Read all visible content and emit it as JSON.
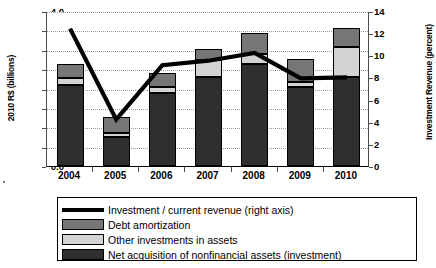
{
  "chart_data": {
    "type": "bar",
    "title": "",
    "xlabel": "",
    "ylabel": "2010 R$ (billions)",
    "y2label": "Investment Revenue (percent)",
    "categories": [
      "2004",
      "2005",
      "2006",
      "2007",
      "2008",
      "2009",
      "2010"
    ],
    "ylim": [
      0.0,
      4.0
    ],
    "yticks": [
      "0.0",
      "0.5",
      "1.0",
      "1.5",
      "2.0",
      "2.5",
      "3.0",
      "3.5",
      "4.0"
    ],
    "ytick_values": [
      0.0,
      0.5,
      1.0,
      1.5,
      2.0,
      2.5,
      3.0,
      3.5,
      4.0
    ],
    "y2lim": [
      0,
      14
    ],
    "y2ticks": [
      "0",
      "2",
      "4",
      "6",
      "8",
      "10",
      "12",
      "14"
    ],
    "y2tick_values": [
      0,
      2,
      4,
      6,
      8,
      10,
      12,
      14
    ],
    "grid": true,
    "stacked": true,
    "legend_position": "below",
    "series": [
      {
        "name": "Net acquisition of nonfinancial assets (investment)",
        "axis": "left",
        "kind": "bar",
        "color": "#2f2f2f",
        "values": [
          2.1,
          0.75,
          1.88,
          2.3,
          2.63,
          2.05,
          2.3
        ]
      },
      {
        "name": "Other investments in assets",
        "axis": "left",
        "kind": "bar",
        "color": "#d3d3d3",
        "values": [
          0.18,
          0.1,
          0.15,
          0.43,
          0.25,
          0.12,
          0.78
        ]
      },
      {
        "name": "Debt amortization",
        "axis": "left",
        "kind": "bar",
        "color": "#767676",
        "values": [
          0.35,
          0.41,
          0.37,
          0.3,
          0.55,
          0.58,
          0.49
        ]
      },
      {
        "name": "Investment / current revenue (right axis)",
        "axis": "right",
        "kind": "line",
        "color": "#000000",
        "values": [
          12.5,
          4.3,
          9.2,
          9.6,
          10.3,
          8.0,
          8.1
        ]
      }
    ],
    "totals": [
      2.63,
      1.26,
      2.4,
      3.03,
      3.43,
      2.75,
      3.57
    ]
  },
  "legend": {
    "items": [
      {
        "label": "Investment / current revenue (right axis)",
        "key": "line"
      },
      {
        "label": "Debt amortization",
        "key": "swatch-debt"
      },
      {
        "label": "Other investments in assets",
        "key": "swatch-other"
      },
      {
        "label": "Net acquisition of nonfinancial assets (investment)",
        "key": "swatch-net"
      }
    ]
  }
}
